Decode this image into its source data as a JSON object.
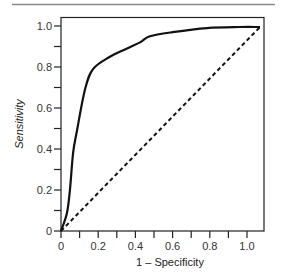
{
  "chart_data": {
    "type": "line",
    "title": "",
    "xlabel": "1 – Specificity",
    "ylabel": "Sensitivity",
    "xlim": [
      0,
      1.09
    ],
    "ylim": [
      0,
      1.04
    ],
    "x_ticks": [
      0,
      0.1,
      0.2,
      0.3,
      0.4,
      0.5,
      0.6,
      0.7,
      0.8,
      0.9,
      1.0
    ],
    "x_tick_labels": [
      "0",
      "",
      "0.2",
      "",
      "0.4",
      "",
      "0.6",
      "",
      "0.8",
      "",
      "1.0"
    ],
    "y_ticks": [
      0,
      0.1,
      0.2,
      0.3,
      0.4,
      0.5,
      0.6,
      0.7,
      0.8,
      0.9,
      1.0
    ],
    "y_tick_labels": [
      "0",
      "",
      "0.2",
      "",
      "0.4",
      "",
      "0.6",
      "",
      "0.8",
      "",
      "1.0"
    ],
    "grid": false,
    "legend": null,
    "series": [
      {
        "name": "ROC curve",
        "style": "solid",
        "color": "#111111",
        "x": [
          0,
          0.032,
          0.048,
          0.065,
          0.086,
          0.129,
          0.172,
          0.263,
          0.355,
          0.425,
          0.478,
          0.6,
          0.785,
          0.96,
          1.07
        ],
        "y": [
          0,
          0.088,
          0.2,
          0.38,
          0.49,
          0.69,
          0.79,
          0.85,
          0.89,
          0.92,
          0.95,
          0.97,
          0.99,
          0.995,
          0.995
        ]
      },
      {
        "name": "Chance (diagonal)",
        "style": "dashed",
        "color": "#111111",
        "x": [
          0,
          1.07
        ],
        "y": [
          0,
          0.995
        ]
      }
    ]
  },
  "colors": {
    "axis": "#222222",
    "top_rule": "#888888",
    "line": "#111111"
  }
}
